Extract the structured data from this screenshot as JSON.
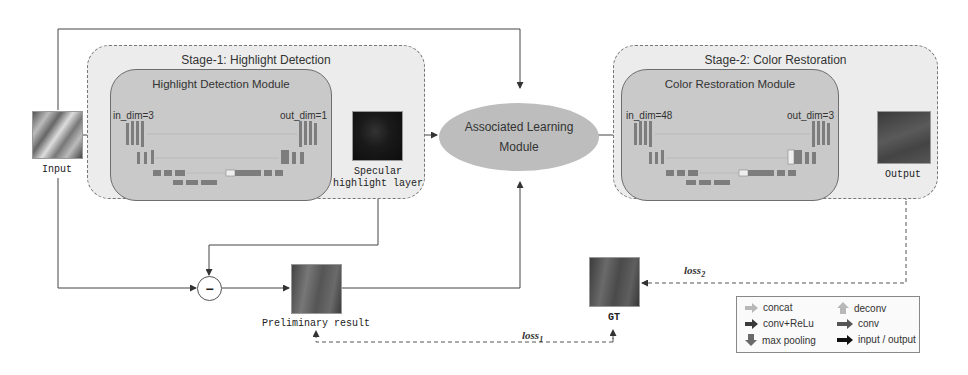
{
  "diagram": {
    "stage1": {
      "title": "Stage-1: Highlight Detection",
      "module_title": "Highlight Detection Module",
      "in_dim": "in_dim=3",
      "out_dim": "out_dim=1"
    },
    "stage2": {
      "title": "Stage-2: Color Restoration",
      "module_title": "Color Restoration Module",
      "in_dim": "in_dim=48",
      "out_dim": "out_dim=3"
    },
    "center": {
      "line1": "Associated Learning",
      "line2": "Module"
    },
    "nodes": {
      "input": "Input",
      "specular_line1": "Specular",
      "specular_line2": "highlight layer",
      "preliminary": "Preliminary result",
      "gt": "GT",
      "output": "Output",
      "subtract_symbol": "−"
    },
    "losses": {
      "loss1": "loss",
      "loss1_sub": "1",
      "loss2": "loss",
      "loss2_sub": "2"
    },
    "legend": [
      {
        "label": "concat",
        "icon": "arrow-right-icon",
        "color": "#b8b8b8"
      },
      {
        "label": "deconv",
        "icon": "arrow-up-icon",
        "color": "#b8b8b8"
      },
      {
        "label": "conv+ReLu",
        "icon": "arrow-right-icon",
        "color": "#3a3a3a"
      },
      {
        "label": "conv",
        "icon": "arrow-right-icon",
        "color": "#555555"
      },
      {
        "label": "max pooling",
        "icon": "arrow-down-icon",
        "color": "#6a6a6a"
      },
      {
        "label": "input / output",
        "icon": "arrow-right-icon",
        "color": "#111111"
      }
    ],
    "colors": {
      "stage_bg": "#ececec",
      "module_bg": "#c9c9c9",
      "ellipse_bg": "#bdbdbd",
      "block": "#7a7a7a",
      "line": "#444444"
    }
  }
}
